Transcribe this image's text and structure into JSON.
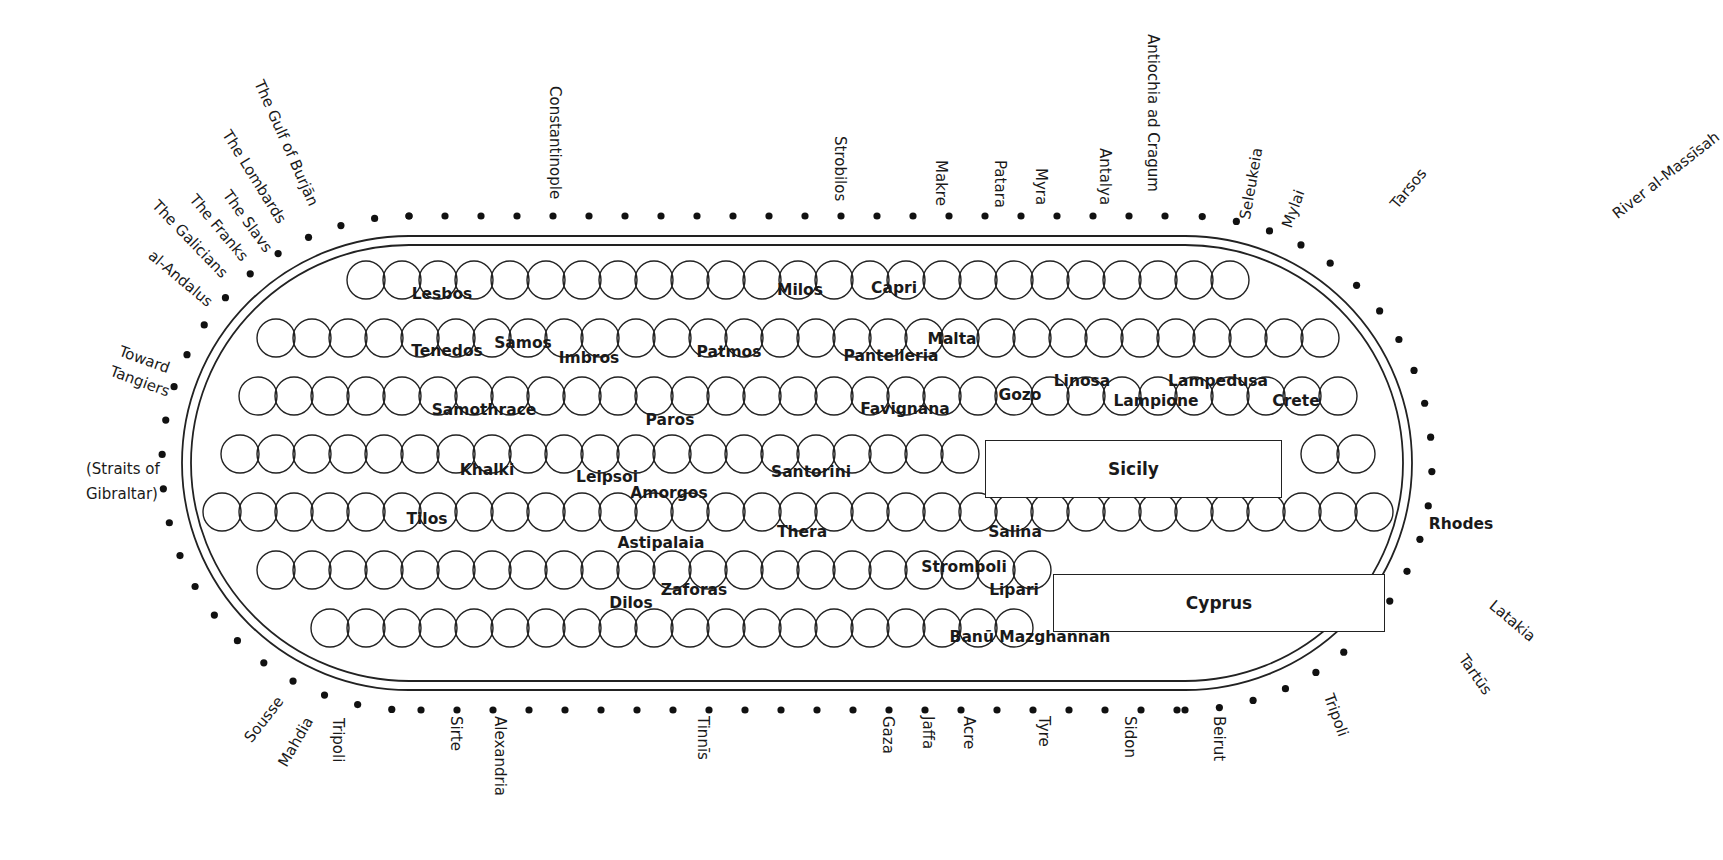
{
  "colors": {
    "ink": "#1a1a1a",
    "background": "#ffffff"
  },
  "frame": {
    "outer": {
      "x": 182,
      "y": 236,
      "w": 1230,
      "h": 454
    },
    "inner_inset": 9
  },
  "coast_labels": {
    "top": [
      {
        "name": "The Gulf of Burjān",
        "x": 265,
        "y": 78,
        "angle": 66
      },
      {
        "name": "The Lombards",
        "x": 232,
        "y": 128,
        "angle": 58
      },
      {
        "name": "The Slavs",
        "x": 232,
        "y": 188,
        "angle": 54
      },
      {
        "name": "The Franks",
        "x": 198,
        "y": 192,
        "angle": 50
      },
      {
        "name": "The Galicians",
        "x": 160,
        "y": 198,
        "angle": 46
      },
      {
        "name": "al-Andalus",
        "x": 155,
        "y": 248,
        "angle": 40
      },
      {
        "name": "Constantinople",
        "x": 562,
        "y": 86,
        "angle": 90
      },
      {
        "name": "Strobilos",
        "x": 847,
        "y": 136,
        "angle": 90
      },
      {
        "name": "Makre",
        "x": 948,
        "y": 160,
        "angle": 90
      },
      {
        "name": "Patara",
        "x": 1007,
        "y": 160,
        "angle": 90
      },
      {
        "name": "Myra",
        "x": 1048,
        "y": 168,
        "angle": 90
      },
      {
        "name": "Antalya",
        "x": 1112,
        "y": 148,
        "angle": 90
      },
      {
        "name": "Antiochia ad Cragum",
        "x": 1160,
        "y": 34,
        "angle": 90
      },
      {
        "name": "Seleukeia",
        "x": 1238,
        "y": 218,
        "angle": -80
      },
      {
        "name": "Mylai",
        "x": 1280,
        "y": 225,
        "angle": -70
      },
      {
        "name": "Tarsos",
        "x": 1388,
        "y": 202,
        "angle": -50
      },
      {
        "name": "River al-Massīsah",
        "x": 1610,
        "y": 210,
        "angle": -38
      }
    ],
    "left": [
      {
        "name": "Toward",
        "x": 122,
        "y": 344,
        "angle": 20
      },
      {
        "name": "Tangiers",
        "x": 113,
        "y": 364,
        "angle": 20
      },
      {
        "name": "(Straits of",
        "x": 86,
        "y": 462,
        "angle": 0
      },
      {
        "name": "Gibraltar)",
        "x": 86,
        "y": 487,
        "angle": 0
      }
    ],
    "bottom": [
      {
        "name": "Sousse",
        "x": 242,
        "y": 736,
        "angle": -52
      },
      {
        "name": "Mahdia",
        "x": 276,
        "y": 762,
        "angle": -60
      },
      {
        "name": "Tripoli",
        "x": 345,
        "y": 718,
        "angle": 90
      },
      {
        "name": "Sirte",
        "x": 463,
        "y": 716,
        "angle": 90
      },
      {
        "name": "Alexandria",
        "x": 507,
        "y": 716,
        "angle": 90
      },
      {
        "name": "Tinnīs",
        "x": 710,
        "y": 716,
        "angle": 90
      },
      {
        "name": "Gaza",
        "x": 895,
        "y": 716,
        "angle": 90
      },
      {
        "name": "Jaffa",
        "x": 935,
        "y": 716,
        "angle": 90
      },
      {
        "name": "Acre",
        "x": 976,
        "y": 716,
        "angle": 90
      },
      {
        "name": "Tyre",
        "x": 1051,
        "y": 716,
        "angle": 90
      },
      {
        "name": "Sidon",
        "x": 1137,
        "y": 716,
        "angle": 90
      },
      {
        "name": "Beirut",
        "x": 1226,
        "y": 716,
        "angle": 90
      },
      {
        "name": "Tripoli",
        "x": 1335,
        "y": 692,
        "angle": 70
      }
    ],
    "right": [
      {
        "name": "Latakia",
        "x": 1496,
        "y": 598,
        "angle": 40
      },
      {
        "name": "Tartūs",
        "x": 1468,
        "y": 652,
        "angle": 55
      }
    ]
  },
  "islands": [
    {
      "name": "Lesbos",
      "x": 442,
      "y": 294
    },
    {
      "name": "Tenedos",
      "x": 447,
      "y": 351
    },
    {
      "name": "Samos",
      "x": 523,
      "y": 343
    },
    {
      "name": "Imbros",
      "x": 589,
      "y": 358
    },
    {
      "name": "Patmos",
      "x": 729,
      "y": 352
    },
    {
      "name": "Milos",
      "x": 800,
      "y": 290
    },
    {
      "name": "Capri",
      "x": 894,
      "y": 288
    },
    {
      "name": "Malta",
      "x": 952,
      "y": 339
    },
    {
      "name": "Pantelleria",
      "x": 891,
      "y": 356
    },
    {
      "name": "Favignana",
      "x": 905,
      "y": 409
    },
    {
      "name": "Gozo",
      "x": 1020,
      "y": 395
    },
    {
      "name": "Linosa",
      "x": 1082,
      "y": 381
    },
    {
      "name": "Lampedusa",
      "x": 1218,
      "y": 381
    },
    {
      "name": "Lampione",
      "x": 1156,
      "y": 401
    },
    {
      "name": "Crete",
      "x": 1296,
      "y": 401
    },
    {
      "name": "Samothrace",
      "x": 484,
      "y": 410
    },
    {
      "name": "Paros",
      "x": 670,
      "y": 420
    },
    {
      "name": "Khalki",
      "x": 487,
      "y": 470
    },
    {
      "name": "Leipsoi",
      "x": 607,
      "y": 477
    },
    {
      "name": "Amorgos",
      "x": 669,
      "y": 493
    },
    {
      "name": "Santorini",
      "x": 811,
      "y": 472
    },
    {
      "name": "Tilos",
      "x": 427,
      "y": 519
    },
    {
      "name": "Thera",
      "x": 802,
      "y": 532
    },
    {
      "name": "Astipalaia",
      "x": 661,
      "y": 543
    },
    {
      "name": "Zaforas",
      "x": 694,
      "y": 590
    },
    {
      "name": "Dilos",
      "x": 631,
      "y": 603
    },
    {
      "name": "Salina",
      "x": 1015,
      "y": 532
    },
    {
      "name": "Stromboli",
      "x": 964,
      "y": 567
    },
    {
      "name": "Lipari",
      "x": 1014,
      "y": 590
    },
    {
      "name": "Banū Mazghānnah",
      "x": 1030,
      "y": 637
    },
    {
      "name": "Rhodes",
      "x": 1461,
      "y": 524
    }
  ],
  "large_islands": [
    {
      "name": "Sicily",
      "x": 985,
      "y": 440,
      "w": 295,
      "h": 56
    },
    {
      "name": "Cyprus",
      "x": 1053,
      "y": 574,
      "w": 330,
      "h": 56
    }
  ]
}
